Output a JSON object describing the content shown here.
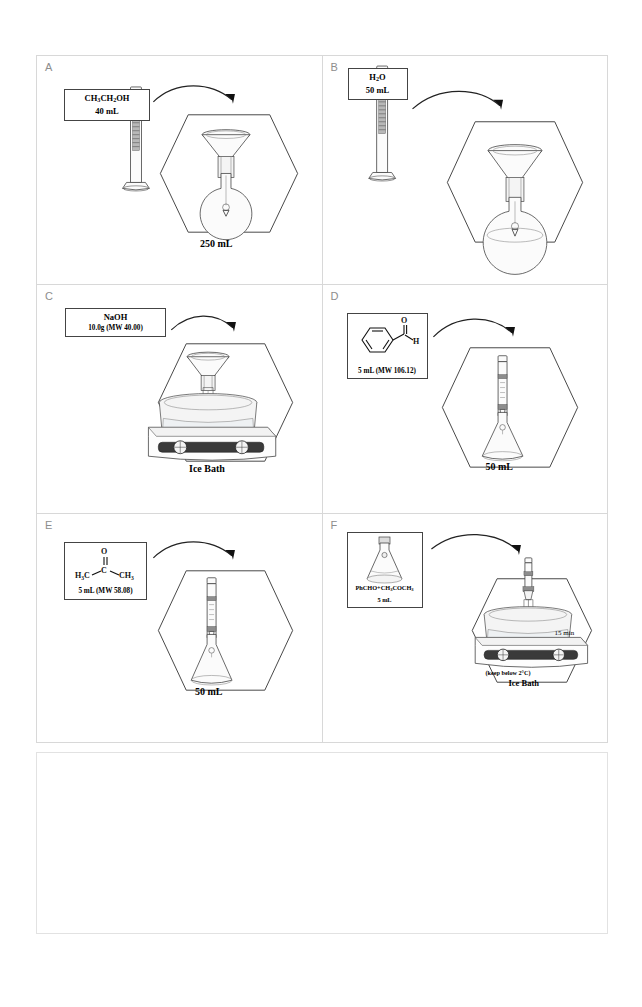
{
  "figure": {
    "panel_count": 6,
    "letters": [
      "A",
      "B",
      "C",
      "D",
      "E",
      "F"
    ]
  },
  "panels": [
    {
      "letter": "A",
      "reagent_name": "CH3CH2OH",
      "reagent_name_html": "CH<sub>3</sub>CH<sub>2</sub>OH",
      "amount": "40 mL",
      "vessel_label": "250 mL",
      "apparatus": [
        "graduated-cylinder",
        "funnel",
        "round-bottom-flask"
      ],
      "action": "pour-ethanol-into-flask"
    },
    {
      "letter": "B",
      "reagent_name": "H2O",
      "reagent_name_html": "H<sub>2</sub>O",
      "amount": "50 mL",
      "vessel_label": "",
      "apparatus": [
        "graduated-cylinder",
        "funnel",
        "round-bottom-flask"
      ],
      "action": "pour-water-into-flask"
    },
    {
      "letter": "C",
      "reagent_name": "NaOH",
      "reagent_name_html": "NaOH",
      "amount": "10.0g (MW 40.00)",
      "vessel_label": "Ice Bath",
      "apparatus": [
        "funnel",
        "round-bottom-flask",
        "ice-bath",
        "stir-plate"
      ],
      "action": "add-sodium-hydroxide"
    },
    {
      "letter": "D",
      "reagent_name": "benzaldehyde",
      "reagent_name_html": "",
      "amount": "5 mL (MW 106.12)",
      "vessel_label": "50 mL",
      "structure": {
        "type": "benzaldehyde",
        "atoms": [
          "O",
          "C",
          "H"
        ],
        "ring": "benzene"
      },
      "apparatus": [
        "pipette",
        "erlenmeyer-flask"
      ],
      "action": "measure-benzaldehyde"
    },
    {
      "letter": "E",
      "reagent_name": "acetone",
      "reagent_name_html": "",
      "amount": "5 mL (MW 58.08)",
      "vessel_label": "50 mL",
      "structure": {
        "type": "acetone",
        "atoms": [
          "O",
          "C",
          "H3C",
          "CH3"
        ]
      },
      "apparatus": [
        "pipette",
        "erlenmeyer-flask"
      ],
      "action": "measure-acetone"
    },
    {
      "letter": "F",
      "reagent_name": "PhCHO+CH3COCH3",
      "reagent_name_html": "PhCHO+CH<sub>3</sub>COCH<sub>3</sub>",
      "amount": "5 mL",
      "vessel_label": "Ice Bath",
      "note_temperature": "(keep below 2°C)",
      "note_time": "15 min",
      "apparatus": [
        "erlenmeyer-flask",
        "syringe",
        "ice-bath",
        "stir-plate"
      ],
      "action": "add-mixture-dropwise"
    }
  ],
  "molecules": {
    "benzaldehyde": {
      "O": "O",
      "C": "C",
      "H": "H"
    },
    "acetone": {
      "O": "O",
      "C": "C",
      "left": "H3C",
      "right": "CH3"
    }
  },
  "colors": {
    "ink": "#222222",
    "panel_border": "#d8d8d8",
    "glass": "#fbfbfb",
    "plate_dark": "#4a4a4a",
    "letter_gray": "#8d8d8d",
    "page_background": "#ffffff"
  }
}
